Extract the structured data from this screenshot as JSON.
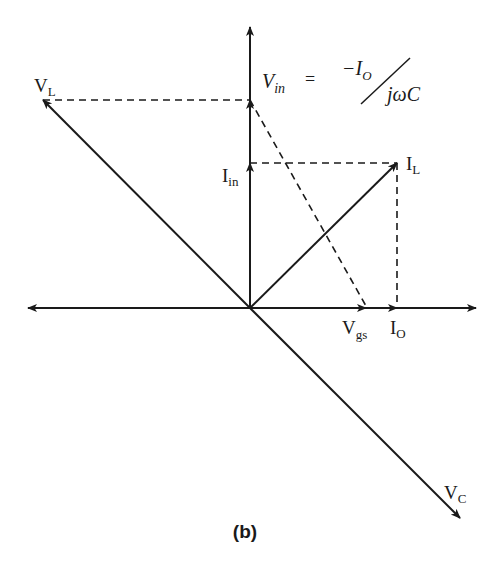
{
  "figure": {
    "caption": "(b)",
    "type": "phasor diagram"
  },
  "labels": {
    "VL": {
      "main": "V",
      "sub": "L"
    },
    "Vin": {
      "main": "V",
      "sub": "in"
    },
    "equals": "=",
    "numerator": "−I",
    "numerator_sub": "O",
    "denominator": "jωC",
    "Iin": {
      "main": "I",
      "sub": "in"
    },
    "IL": {
      "main": "I",
      "sub": "L"
    },
    "Vgs": {
      "main": "V",
      "sub": "gs"
    },
    "IO": {
      "main": "I",
      "sub": "O"
    },
    "VC": {
      "main": "V",
      "sub": "C"
    }
  },
  "phasors": [
    {
      "name": "V_L",
      "from": [
        250,
        308
      ],
      "to": [
        43,
        100
      ],
      "style": "solid"
    },
    {
      "name": "V_in",
      "from": [
        250,
        308
      ],
      "to": [
        250,
        100
      ],
      "style": "solid"
    },
    {
      "name": "I_in",
      "from": [
        250,
        308
      ],
      "to": [
        250,
        163
      ],
      "style": "solid"
    },
    {
      "name": "I_L",
      "from": [
        250,
        308
      ],
      "to": [
        397,
        163
      ],
      "style": "solid"
    },
    {
      "name": "V_gs",
      "from": [
        250,
        308
      ],
      "to": [
        366,
        308
      ],
      "style": "solid"
    },
    {
      "name": "I_O",
      "from": [
        250,
        308
      ],
      "to": [
        397,
        308
      ],
      "style": "solid"
    },
    {
      "name": "V_C",
      "from": [
        250,
        308
      ],
      "to": [
        460,
        518
      ],
      "style": "solid"
    }
  ],
  "colors": {
    "stroke": "#1a1a1a",
    "background": "#ffffff"
  }
}
